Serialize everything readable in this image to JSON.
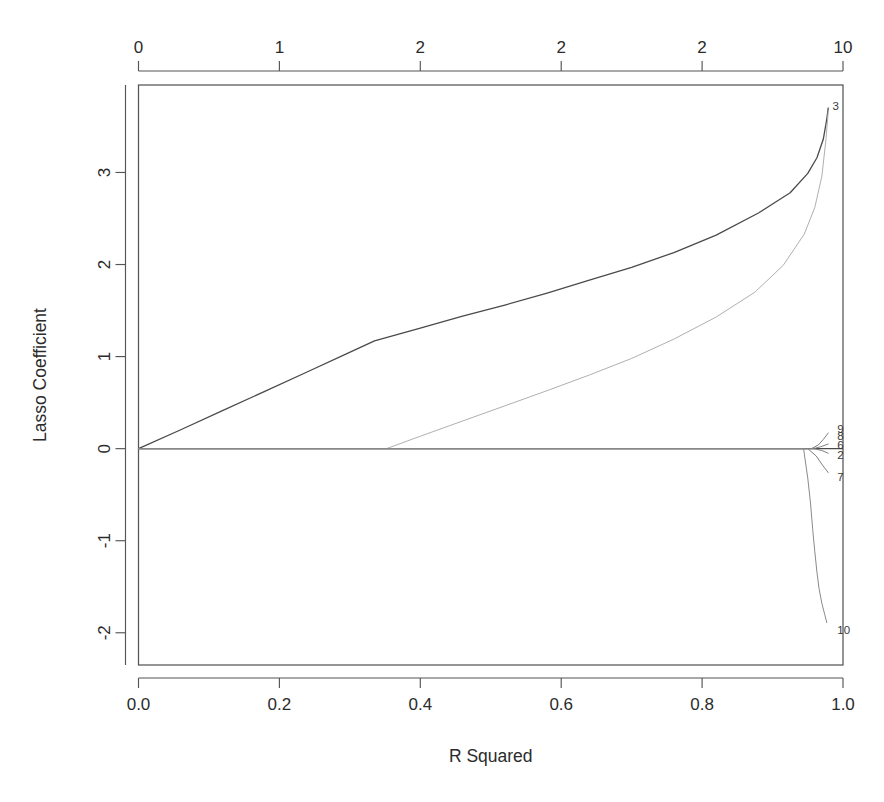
{
  "figure": {
    "width": 884,
    "height": 802,
    "background": "#ffffff",
    "line_color": "#4a4a4a",
    "faint_line_color": "#a8a8a8",
    "text_color": "#2b2b2b"
  },
  "chart_data": {
    "type": "line",
    "title": "",
    "subtitle": "",
    "xlabel": "R Squared",
    "ylabel": "Lasso Coefficient",
    "xlim": [
      0.0,
      1.0
    ],
    "ylim": [
      -2.35,
      3.95
    ],
    "grid": false,
    "legend_position": "none",
    "x_ticks": [
      "0.0",
      "0.2",
      "0.4",
      "0.6",
      "0.8",
      "1.0"
    ],
    "x_tick_values": [
      0.0,
      0.2,
      0.4,
      0.6,
      0.8,
      1.0
    ],
    "y_ticks": [
      "3",
      "2",
      "1",
      "0",
      "-1",
      "-2"
    ],
    "y_tick_values": [
      3,
      2,
      1,
      0,
      -1,
      -2
    ],
    "top_axis_label": "",
    "top_ticks": [
      "0",
      "1",
      "2",
      "2",
      "2",
      "10"
    ],
    "top_tick_values": [
      0.0,
      0.2,
      0.4,
      0.6,
      0.8,
      1.0
    ],
    "zero_reference_line": 0,
    "series": [
      {
        "name": "3",
        "label": "3",
        "color": "#4a4a4a",
        "width": 1.3,
        "end_label_y": 3.72,
        "x": [
          0.0,
          0.06,
          0.12,
          0.18,
          0.24,
          0.295,
          0.335,
          0.4,
          0.46,
          0.52,
          0.58,
          0.64,
          0.7,
          0.76,
          0.82,
          0.88,
          0.925,
          0.95,
          0.963,
          0.972,
          0.977,
          0.979
        ],
        "values": [
          0.0,
          0.205,
          0.415,
          0.625,
          0.835,
          1.03,
          1.17,
          1.31,
          1.44,
          1.56,
          1.69,
          1.83,
          1.97,
          2.13,
          2.32,
          2.56,
          2.78,
          2.99,
          3.16,
          3.36,
          3.58,
          3.7
        ]
      },
      {
        "name": "9",
        "label": "9",
        "color": "#b0b0b0",
        "width": 1.0,
        "end_label_y": 3.7,
        "x": [
          0.352,
          0.4,
          0.46,
          0.52,
          0.58,
          0.64,
          0.7,
          0.76,
          0.82,
          0.875,
          0.915,
          0.945,
          0.96,
          0.97,
          0.976,
          0.979
        ],
        "values": [
          0.0,
          0.135,
          0.3,
          0.465,
          0.63,
          0.8,
          0.98,
          1.19,
          1.43,
          1.7,
          1.99,
          2.33,
          2.62,
          2.96,
          3.37,
          3.66
        ]
      },
      {
        "name": "8",
        "label": "8",
        "color": "#808080",
        "width": 1.0,
        "end_label_y": 0.19,
        "x": [
          0.0,
          0.955,
          0.965,
          0.972,
          0.979
        ],
        "values": [
          0.0,
          0.0,
          0.04,
          0.1,
          0.17
        ]
      },
      {
        "name": "6",
        "label": "6",
        "color": "#808080",
        "width": 1.0,
        "end_label_y": 0.06,
        "x": [
          0.0,
          0.958,
          0.968,
          0.979
        ],
        "values": [
          0.0,
          0.0,
          0.02,
          0.05
        ]
      },
      {
        "name": "2",
        "label": "2",
        "color": "#808080",
        "width": 1.0,
        "end_label_y": -0.06,
        "x": [
          0.0,
          0.958,
          0.97,
          0.979
        ],
        "values": [
          0.0,
          0.0,
          -0.02,
          -0.05
        ]
      },
      {
        "name": "7",
        "label": "7",
        "color": "#808080",
        "width": 1.0,
        "end_label_y": -0.3,
        "x": [
          0.0,
          0.95,
          0.962,
          0.971,
          0.979
        ],
        "values": [
          0.0,
          0.0,
          -0.08,
          -0.18,
          -0.26
        ]
      },
      {
        "name": "10",
        "label": "10",
        "color": "#8a8a8a",
        "width": 1.0,
        "end_label_y": -1.96,
        "x": [
          0.0,
          0.944,
          0.95,
          0.954,
          0.957,
          0.96,
          0.963,
          0.966,
          0.97,
          0.974,
          0.977
        ],
        "values": [
          0.0,
          0.0,
          -0.32,
          -0.6,
          -0.88,
          -1.12,
          -1.34,
          -1.52,
          -1.68,
          -1.8,
          -1.89
        ]
      }
    ],
    "annotations": [
      {
        "text": "3",
        "x": 0.985,
        "y": 3.72
      },
      {
        "text": "9",
        "x": 0.992,
        "y": 0.21
      },
      {
        "text": "8",
        "x": 0.992,
        "y": 0.14
      },
      {
        "text": "6",
        "x": 0.992,
        "y": 0.04
      },
      {
        "text": "2",
        "x": 0.992,
        "y": -0.07
      },
      {
        "text": "7",
        "x": 0.992,
        "y": -0.31
      },
      {
        "text": "10",
        "x": 0.992,
        "y": -1.97
      }
    ]
  }
}
